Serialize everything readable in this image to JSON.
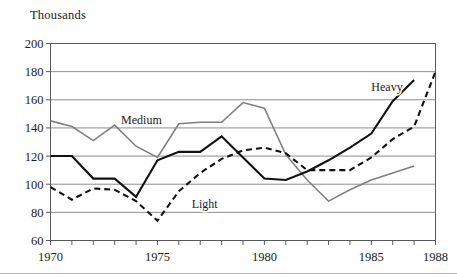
{
  "chart_data": {
    "type": "line",
    "title": "Thousands",
    "xlabel": "",
    "ylabel": "",
    "xlim": [
      1970,
      1988
    ],
    "ylim": [
      60,
      200
    ],
    "yticks": [
      60,
      80,
      100,
      120,
      140,
      160,
      180,
      200
    ],
    "xticks": [
      1970,
      1971,
      1972,
      1973,
      1974,
      1975,
      1976,
      1977,
      1978,
      1979,
      1980,
      1981,
      1982,
      1983,
      1984,
      1985,
      1986,
      1987,
      1988
    ],
    "xtick_labels_shown": [
      1970,
      1975,
      1980,
      1985,
      1988
    ],
    "grid": "horizontal",
    "legend_position": "inline-annotations",
    "series": [
      {
        "name": "Medium",
        "style": "solid",
        "color": "#808080",
        "width": 1.6,
        "label_x": 1973.3,
        "label_y": 143,
        "x": [
          1970,
          1971,
          1972,
          1973,
          1974,
          1975,
          1976,
          1977,
          1978,
          1979,
          1980,
          1981,
          1982,
          1983,
          1984,
          1985,
          1986,
          1987
        ],
        "values": [
          145,
          141,
          131,
          142,
          127,
          119,
          143,
          144,
          144,
          158,
          154,
          121,
          103,
          88,
          96,
          103,
          108,
          113
        ]
      },
      {
        "name": "Heavy",
        "style": "solid",
        "color": "#121212",
        "width": 2.1,
        "label_x": 1985.0,
        "label_y": 166,
        "x": [
          1970,
          1971,
          1972,
          1973,
          1974,
          1975,
          1976,
          1977,
          1978,
          1979,
          1980,
          1981,
          1982,
          1983,
          1984,
          1985,
          1986,
          1987
        ],
        "values": [
          120,
          120,
          104,
          104,
          91,
          117,
          123,
          123,
          134,
          119,
          104,
          103,
          109,
          117,
          126,
          136,
          159,
          174
        ]
      },
      {
        "name": "Light",
        "style": "dashed",
        "color": "#121212",
        "width": 2.1,
        "label_x": 1976.6,
        "label_y": 83,
        "x": [
          1970,
          1971,
          1972,
          1973,
          1974,
          1975,
          1976,
          1977,
          1978,
          1979,
          1980,
          1981,
          1982,
          1983,
          1984,
          1985,
          1986,
          1987,
          1988
        ],
        "values": [
          98,
          89,
          97,
          96,
          88,
          74,
          95,
          108,
          118,
          124,
          126,
          122,
          110,
          110,
          110,
          119,
          132,
          141,
          180
        ]
      }
    ]
  },
  "axis": {
    "ytick_labels": [
      "200",
      "180",
      "160",
      "140",
      "120",
      "100",
      "80",
      "60"
    ],
    "xtick_labels": [
      "1970",
      "1975",
      "1980",
      "1985",
      "1988"
    ]
  },
  "colors": {
    "gridline": "#8d8d8d",
    "frame": "#5a5a5a",
    "medium_series": "#808080",
    "dark_series": "#121212",
    "background": "#ffffff",
    "bottom_rule": "#b9b9b9"
  }
}
